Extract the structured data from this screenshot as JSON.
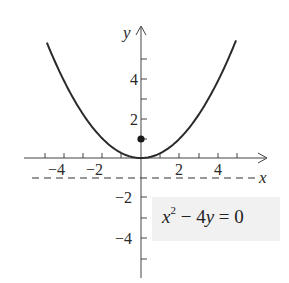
{
  "chart_data": {
    "type": "line",
    "title": "",
    "xlabel": "x",
    "ylabel": "y",
    "xlim": [
      -5.5,
      6.5
    ],
    "ylim": [
      -6.2,
      6.8
    ],
    "x_ticks": [
      -6,
      -5,
      -4,
      -3,
      -2,
      -1,
      1,
      2,
      3,
      4,
      5
    ],
    "x_tick_labels": {
      "-4": "−4",
      "-2": "−2",
      "2": "2",
      "4": "4"
    },
    "y_ticks": [
      -5,
      -4,
      -3,
      -2,
      -1,
      1,
      2,
      3,
      4,
      5
    ],
    "y_tick_labels": {
      "4": "4",
      "2": "2",
      "-2": "−2",
      "-4": "−4"
    },
    "grid": false,
    "series": [
      {
        "name": "parabola",
        "equation": "x^2 - 4y = 0",
        "style": "solid",
        "x_range": [
          -4.85,
          4.9
        ]
      },
      {
        "name": "directrix",
        "equation": "y = -1",
        "style": "dashed"
      }
    ],
    "points": [
      {
        "name": "focus",
        "x": 0,
        "y": 1
      }
    ],
    "annotation": {
      "text_base": "x",
      "text_sup": "2",
      "text_rest": " − 4",
      "text_var": "y",
      "text_end": " = 0"
    }
  },
  "labels": {
    "x_axis": "x",
    "y_axis": "y",
    "xt_m4": "−4",
    "xt_m2": "−2",
    "xt_2": "2",
    "xt_4": "4",
    "yt_4": "4",
    "yt_2": "2",
    "yt_m2": "−2",
    "yt_m4": "−4"
  },
  "colors": {
    "curve": "#2a2a2a",
    "axis": "#444444",
    "label_bg": "#f1f1f1"
  }
}
